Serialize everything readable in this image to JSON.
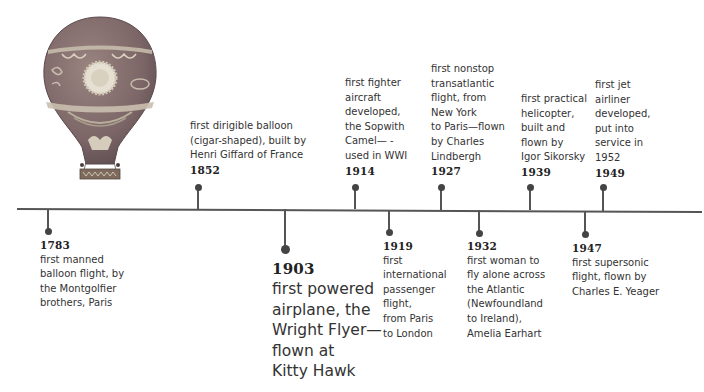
{
  "illustration": {
    "subject": "hot-air-balloon-icon",
    "colors": {
      "envelope": "#8a6f6b",
      "envelope_dark": "#6e5a5c",
      "band": "#c9bfae",
      "sun": "#e6e0d2",
      "basket": "#7d6a5c"
    }
  },
  "timeline": {
    "line_color": "#555555",
    "text_color": "#333333",
    "events": [
      {
        "year": "1783",
        "description": "first manned\nballoon flight, by\nthe Montgolfier\nbrothers, Paris",
        "position": "below",
        "x": 48
      },
      {
        "year": "1852",
        "description": "first dirigible balloon\n(cigar-shaped), built by\nHenri Giffard of France",
        "position": "above",
        "x": 198
      },
      {
        "year": "1903",
        "description": "first powered\nairplane, the\nWright Flyer—\nflown at\nKitty Hawk",
        "position": "below",
        "x": 285,
        "emphasis": true
      },
      {
        "year": "1914",
        "description": "first fighter\naircraft\ndeveloped,\nthe Sopwith\nCamel— -\nused in WWI",
        "position": "above",
        "x": 354
      },
      {
        "year": "1919",
        "description": "first\ninternational\npassenger\nflight,\nfrom Paris\nto London",
        "position": "below",
        "x": 389
      },
      {
        "year": "1927",
        "description": "first nonstop\ntransatlantic\nflight, from\nNew York\nto Paris—flown\nby Charles\nLindbergh",
        "position": "above",
        "x": 440
      },
      {
        "year": "1932",
        "description": "first woman to\nfly alone across\nthe Atlantic\n(Newfoundland\nto Ireland),\nAmelia Earhart",
        "position": "below",
        "x": 478
      },
      {
        "year": "1939",
        "description": "first practical\nhelicopter,\nbuilt and\nflown by\nIgor Sikorsky",
        "position": "above",
        "x": 530
      },
      {
        "year": "1947",
        "description": "first supersonic\nflight, flown by\nCharles E. Yeager",
        "position": "below",
        "x": 584
      },
      {
        "year": "1949",
        "description": "first jet\nairliner\ndeveloped,\nput into\nservice in\n1952",
        "position": "above",
        "x": 603
      }
    ]
  }
}
